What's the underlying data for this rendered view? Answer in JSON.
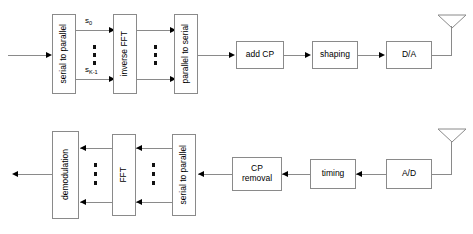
{
  "diagram": {
    "transmitter": {
      "name": "transmitter-chain",
      "blocks": [
        {
          "id": "serial-to-parallel-tx",
          "label": "serial to parallel",
          "orientation": "vertical"
        },
        {
          "id": "inverse-fft",
          "label": "inverse FFT",
          "orientation": "vertical"
        },
        {
          "id": "parallel-to-serial",
          "label": "parallel to serial",
          "orientation": "vertical"
        },
        {
          "id": "add-cp",
          "label": "add CP",
          "orientation": "horizontal"
        },
        {
          "id": "shaping",
          "label": "shaping",
          "orientation": "horizontal"
        },
        {
          "id": "da-converter",
          "label": "D/A",
          "orientation": "horizontal"
        }
      ],
      "signal_labels": [
        {
          "id": "s-0",
          "base": "s",
          "sub": "0"
        },
        {
          "id": "s-k-minus-1",
          "base": "s",
          "sub": "K-1"
        }
      ],
      "antenna": "transmit-antenna"
    },
    "receiver": {
      "name": "receiver-chain",
      "blocks": [
        {
          "id": "demodulation",
          "label": "demodulation",
          "orientation": "vertical"
        },
        {
          "id": "fft",
          "label": "FFT",
          "orientation": "vertical"
        },
        {
          "id": "serial-to-parallel-rx",
          "label": "serial to parallel",
          "orientation": "vertical"
        },
        {
          "id": "cp-removal",
          "label": "CP\nremoval",
          "orientation": "horizontal"
        },
        {
          "id": "timing",
          "label": "timing",
          "orientation": "horizontal"
        },
        {
          "id": "ad-converter",
          "label": "A/D",
          "orientation": "horizontal"
        }
      ],
      "antenna": "receive-antenna"
    },
    "colors": {
      "line": "#8a8a8a",
      "arrow": "#000000",
      "text": "#000000",
      "background": "#ffffff"
    }
  }
}
